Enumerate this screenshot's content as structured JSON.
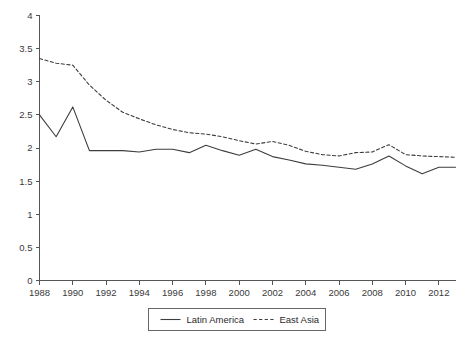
{
  "chart_data": {
    "type": "line",
    "title": "",
    "subtitle": "",
    "xlabel": "",
    "ylabel": "",
    "xlim": [
      1988,
      2013
    ],
    "ylim": [
      0,
      4
    ],
    "grid": false,
    "legend_position": "bottom-center",
    "x": [
      1988,
      1989,
      1990,
      1991,
      1992,
      1993,
      1994,
      1995,
      1996,
      1997,
      1998,
      1999,
      2000,
      2001,
      2002,
      2003,
      2004,
      2005,
      2006,
      2007,
      2008,
      2009,
      2010,
      2011,
      2012,
      2013
    ],
    "xticks": [
      1988,
      1990,
      1992,
      1994,
      1996,
      1998,
      2000,
      2002,
      2004,
      2006,
      2008,
      2010,
      2012
    ],
    "xtick_labels": [
      "1988",
      "1990",
      "1992",
      "1994",
      "1996",
      "1998",
      "2000",
      "2002",
      "2004",
      "2006",
      "2008",
      "2010",
      "2012"
    ],
    "yticks": [
      0,
      0.5,
      1,
      1.5,
      2,
      2.5,
      3,
      3.5,
      4
    ],
    "ytick_labels": [
      "0",
      "0.5",
      "1",
      "1.5",
      "2",
      "2.5",
      "3",
      "3.5",
      "4"
    ],
    "series": [
      {
        "name": "Latin America",
        "style": "solid",
        "color": "#3d3d3d",
        "values": [
          2.5,
          2.17,
          2.62,
          1.96,
          1.96,
          1.96,
          1.94,
          1.98,
          1.98,
          1.93,
          2.04,
          1.96,
          1.89,
          1.98,
          1.87,
          1.82,
          1.76,
          1.74,
          1.71,
          1.68,
          1.76,
          1.88,
          1.73,
          1.61,
          1.71,
          1.71
        ]
      },
      {
        "name": "East Asia",
        "style": "dashed",
        "color": "#3d3d3d",
        "values": [
          3.35,
          3.28,
          3.25,
          2.95,
          2.72,
          2.54,
          2.44,
          2.35,
          2.28,
          2.23,
          2.21,
          2.17,
          2.11,
          2.06,
          2.1,
          2.04,
          1.95,
          1.9,
          1.88,
          1.93,
          1.94,
          2.05,
          1.9,
          1.88,
          1.87,
          1.86
        ]
      }
    ]
  },
  "legend": {
    "entries": [
      {
        "label": "Latin America",
        "style": "solid"
      },
      {
        "label": "East Asia",
        "style": "dashed"
      }
    ]
  }
}
